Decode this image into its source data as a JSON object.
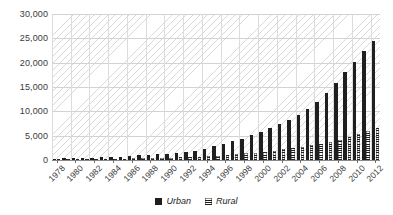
{
  "chart_data": {
    "type": "bar",
    "title": "",
    "subtitle": "",
    "xlabel": "",
    "ylabel": "",
    "ylim": [
      0,
      30000
    ],
    "ytick_labels": [
      "0",
      "5,000",
      "10,000",
      "15,000",
      "20,000",
      "25,000",
      "30,000"
    ],
    "ytick_values": [
      0,
      5000,
      10000,
      15000,
      20000,
      25000,
      30000
    ],
    "grid": true,
    "legend_position": "bottom-center",
    "x": [
      1978,
      1979,
      1980,
      1981,
      1982,
      1983,
      1984,
      1985,
      1986,
      1987,
      1988,
      1989,
      1990,
      1991,
      1992,
      1993,
      1994,
      1995,
      1996,
      1997,
      1998,
      1999,
      2000,
      2001,
      2002,
      2003,
      2004,
      2005,
      2006,
      2007,
      2008,
      2009,
      2010,
      2011,
      2012
    ],
    "xtick_labels": [
      "1978",
      "1980",
      "1982",
      "1984",
      "1986",
      "1988",
      "1990",
      "1992",
      "1994",
      "1996",
      "1998",
      "2000",
      "2002",
      "2004",
      "2006",
      "2008",
      "2010",
      "2012"
    ],
    "series": [
      {
        "name": "Urban",
        "color": "#1f1f1f",
        "pattern": "solid",
        "values": [
          310,
          340,
          380,
          420,
          470,
          520,
          600,
          700,
          820,
          940,
          1080,
          1180,
          1280,
          1450,
          1680,
          1950,
          2300,
          2800,
          3300,
          3900,
          4400,
          5100,
          5800,
          6600,
          7400,
          8300,
          9300,
          10500,
          12000,
          13800,
          15800,
          18000,
          20200,
          22300,
          24500
        ]
      },
      {
        "name": "Rural",
        "color": "#1c1c1c",
        "pattern": "checkered",
        "values": [
          130,
          140,
          155,
          170,
          190,
          210,
          240,
          275,
          315,
          355,
          400,
          430,
          470,
          520,
          580,
          660,
          760,
          900,
          1050,
          1200,
          1350,
          1520,
          1720,
          1940,
          2180,
          2420,
          2700,
          3000,
          3350,
          3750,
          4200,
          4750,
          5350,
          5950,
          6600
        ]
      }
    ]
  },
  "legend": {
    "items": [
      {
        "label": "Urban",
        "swatch": "solid-dark-square"
      },
      {
        "label": "Rural",
        "swatch": "checkered-square"
      }
    ]
  },
  "axes": {
    "y_axis_name": "y-axis",
    "x_axis_name": "x-axis"
  }
}
